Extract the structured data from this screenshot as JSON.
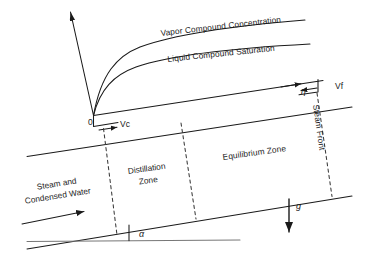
{
  "figure": {
    "stroke_color": "#1a1a1a",
    "background_color": "#ffffff",
    "dash_color": "#3a3a3a"
  },
  "curves": {
    "vapor_label": "Vapor Compound Concentration",
    "liquid_label": "Liquid Compound Saturation",
    "origin_label": "0"
  },
  "axes": {
    "vertical_axis_name": "vertical-axis-arrow",
    "horizontal_interface_name": "upper-interface-line"
  },
  "vectors": {
    "vc": "Vc",
    "vf": "Vf",
    "eta": "η",
    "gravity": "g",
    "alpha": "α"
  },
  "zones": [
    {
      "id": "steam-condensed",
      "line1": "Steam and",
      "line2": "Condensed Water"
    },
    {
      "id": "distillation",
      "line1": "Distillation",
      "line2": "Zone"
    },
    {
      "id": "equilibrium",
      "line1": "Equilibrium Zone",
      "line2": ""
    }
  ],
  "annotations": {
    "steam_front": "Steam Front"
  }
}
